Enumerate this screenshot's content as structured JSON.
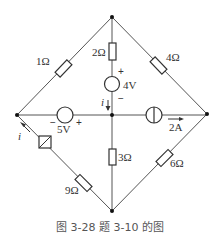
{
  "figure": {
    "caption": "图 3-28    题 3-10 的图",
    "nodes": {
      "top": [
        112,
        17
      ],
      "left": [
        17,
        115
      ],
      "right": [
        207,
        114
      ],
      "bottom": [
        112,
        211
      ],
      "center": [
        112,
        115
      ]
    },
    "components": {
      "r_top_left": {
        "label": "1Ω",
        "type": "resistor"
      },
      "r_top_center": {
        "label": "2Ω",
        "type": "resistor"
      },
      "r_top_right": {
        "label": "4Ω",
        "type": "resistor"
      },
      "vs_center": {
        "label": "4V",
        "type": "voltage-source",
        "plus": "+",
        "minus": "−"
      },
      "vs_left": {
        "label": "5V",
        "type": "voltage-source",
        "plus": "+",
        "minus": "−"
      },
      "cs_right": {
        "label": "2A",
        "type": "current-source"
      },
      "r_center_bottom": {
        "label": "3Ω",
        "type": "resistor"
      },
      "r_bottom_right": {
        "label": "6Ω",
        "type": "resistor"
      },
      "r_bottom_left": {
        "label": "9Ω",
        "type": "resistor"
      },
      "dep_source": {
        "label": "",
        "type": "controlled-source"
      }
    },
    "currents": {
      "i_center": "i",
      "i_left": "i"
    }
  }
}
